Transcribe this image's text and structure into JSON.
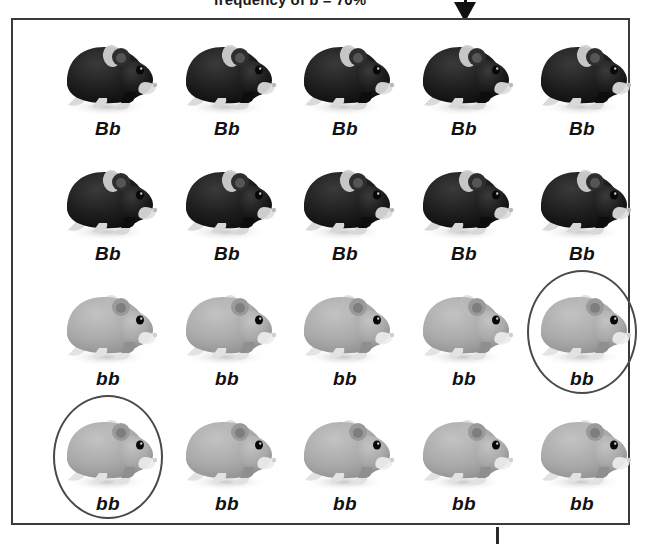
{
  "caption": {
    "text": "frequency of b = 70%",
    "clipped": true
  },
  "arrow": {
    "name": "down-arrow",
    "direction": "down"
  },
  "panel": {
    "border_color": "#3a3a3a",
    "background": "#ffffff"
  },
  "legend": {
    "dark_label": "Bb",
    "light_label": "bb",
    "dark_color": "#1e1e1e",
    "light_color": "#a8a8a8",
    "circle_color": "#4a4a4a"
  },
  "population": {
    "rows": [
      {
        "row_index": 1,
        "phenotype": "dark",
        "cells": [
          {
            "genotype": "Bb",
            "circled": false
          },
          {
            "genotype": "Bb",
            "circled": false
          },
          {
            "genotype": "Bb",
            "circled": false
          },
          {
            "genotype": "Bb",
            "circled": false
          },
          {
            "genotype": "Bb",
            "circled": false
          }
        ]
      },
      {
        "row_index": 2,
        "phenotype": "dark",
        "cells": [
          {
            "genotype": "Bb",
            "circled": false
          },
          {
            "genotype": "Bb",
            "circled": false
          },
          {
            "genotype": "Bb",
            "circled": false
          },
          {
            "genotype": "Bb",
            "circled": false
          },
          {
            "genotype": "Bb",
            "circled": false
          }
        ]
      },
      {
        "row_index": 3,
        "phenotype": "light",
        "cells": [
          {
            "genotype": "bb",
            "circled": false
          },
          {
            "genotype": "bb",
            "circled": false
          },
          {
            "genotype": "bb",
            "circled": false
          },
          {
            "genotype": "bb",
            "circled": false
          },
          {
            "genotype": "bb",
            "circled": true
          }
        ]
      },
      {
        "row_index": 4,
        "phenotype": "light",
        "cells": [
          {
            "genotype": "bb",
            "circled": true
          },
          {
            "genotype": "bb",
            "circled": false
          },
          {
            "genotype": "bb",
            "circled": false
          },
          {
            "genotype": "bb",
            "circled": false
          },
          {
            "genotype": "bb",
            "circled": false
          }
        ]
      }
    ],
    "total_count": 20,
    "dark_count": 10,
    "light_count": 10,
    "circled_count": 2
  }
}
